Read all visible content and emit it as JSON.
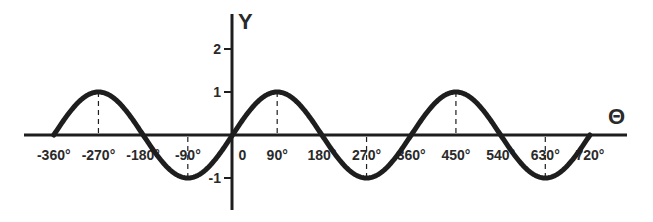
{
  "chart_data": {
    "type": "line",
    "title": "",
    "function": "y = sin(theta)",
    "xlabel": "Θ",
    "ylabel": "Y",
    "xlim": [
      -360,
      720
    ],
    "ylim": [
      -1.5,
      2.5
    ],
    "grid": false,
    "legend": null,
    "x_ticks": [
      -360,
      -270,
      -180,
      -90,
      0,
      90,
      180,
      270,
      360,
      450,
      540,
      630,
      720
    ],
    "x_tick_labels": [
      "-360°",
      "-270°",
      "-180°",
      "-90°",
      "0",
      "90°",
      "180°",
      "270°",
      "360°",
      "450°",
      "540°",
      "630°",
      "720°"
    ],
    "y_ticks": [
      2,
      1,
      -1
    ],
    "y_tick_labels": [
      "2",
      "1",
      "-1"
    ],
    "series": [
      {
        "name": "sin θ",
        "x": [
          -360,
          -270,
          -180,
          -90,
          0,
          90,
          180,
          270,
          360,
          450,
          540,
          630,
          720
        ],
        "values": [
          0,
          1,
          0,
          -1,
          0,
          1,
          0,
          -1,
          0,
          1,
          0,
          -1,
          0
        ]
      }
    ],
    "annotations": [
      {
        "type": "dashed-drop-line",
        "x": -270,
        "y": 1
      },
      {
        "type": "dashed-drop-line",
        "x": -90,
        "y": -1
      },
      {
        "type": "dashed-drop-line",
        "x": 90,
        "y": 1
      },
      {
        "type": "dashed-drop-line",
        "x": 270,
        "y": -1
      },
      {
        "type": "dashed-drop-line",
        "x": 450,
        "y": 1
      },
      {
        "type": "dashed-drop-line",
        "x": 630,
        "y": -1
      }
    ]
  },
  "colors": {
    "curve": "#1e1e1e",
    "axis": "#1e1e1e",
    "background": "#ffffff"
  }
}
